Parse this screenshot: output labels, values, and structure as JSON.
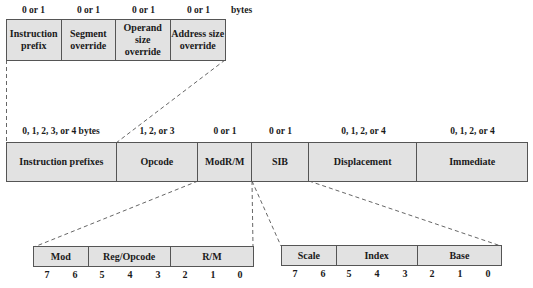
{
  "prefix_detail": {
    "unit_label": "bytes",
    "fields": [
      {
        "size": "0 or 1",
        "label": "Instruction prefix"
      },
      {
        "size": "0 or 1",
        "label": "Segment override"
      },
      {
        "size": "0 or 1",
        "label": "Operand size override"
      },
      {
        "size": "0 or 1",
        "label": "Address size override"
      }
    ]
  },
  "instruction_format": {
    "fields": [
      {
        "size": "0, 1, 2, 3, or 4 bytes",
        "label": "Instruction prefixes"
      },
      {
        "size": "1, 2, or 3",
        "label": "Opcode"
      },
      {
        "size": "0 or 1",
        "label": "ModR/M"
      },
      {
        "size": "0 or 1",
        "label": "SIB"
      },
      {
        "size": "0, 1, 2, or 4",
        "label": "Displacement"
      },
      {
        "size": "0, 1, 2, or 4",
        "label": "Immediate"
      }
    ]
  },
  "modrm_detail": {
    "fields": [
      {
        "label": "Mod"
      },
      {
        "label": "Reg/Opcode"
      },
      {
        "label": "R/M"
      }
    ],
    "bits": [
      "7",
      "6",
      "5",
      "4",
      "3",
      "2",
      "1",
      "0"
    ]
  },
  "sib_detail": {
    "fields": [
      {
        "label": "Scale"
      },
      {
        "label": "Index"
      },
      {
        "label": "Base"
      }
    ],
    "bits": [
      "7",
      "6",
      "5",
      "4",
      "3",
      "2",
      "1",
      "0"
    ]
  },
  "colors": {
    "box_fill": "#e2e2e2",
    "border": "#555555",
    "dashed_line": "#555555"
  }
}
